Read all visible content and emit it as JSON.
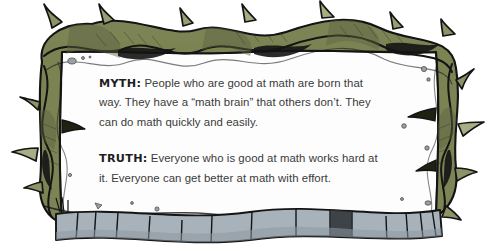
{
  "card": {
    "myth": {
      "label": "MYTH:",
      "text": " People who are good at math are born that way. They have a “math brain” that others don’t. They can do math quickly and easily."
    },
    "truth": {
      "label": "TRUTH:",
      "text": " Everyone who is good at math works hard at it. Everyone can get better at math with effort."
    }
  },
  "colors": {
    "vine_fill": "#7d8456",
    "vine_fill_light": "#8d9366",
    "vine_shadow": "#5d6440",
    "outline": "#141414",
    "stone_fill": "#a8b2ba",
    "stone_shadow": "#8e99a2",
    "card_fill": "#fdfdfd",
    "speck": "#9aa0a4",
    "text": "#3a3a3a",
    "label_text": "#1e1e1e",
    "background": "#ffffff"
  },
  "graphics": {
    "frame_icon": "thorny-vine-frame",
    "bottom_icon": "stone-wall",
    "card_icon": "white-paper-card"
  }
}
